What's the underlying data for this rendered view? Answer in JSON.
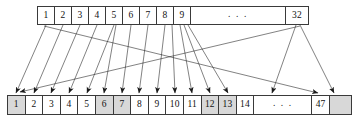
{
  "diagram": {
    "type": "array-mapping-diagram",
    "colors": {
      "shade": "#d8d8d8",
      "stroke": "#3a3a3a",
      "arrow": "#1a1a1a",
      "background": "#ffffff"
    },
    "ellipsis_text": ". . .",
    "top_array": {
      "name": "source-array",
      "size_label": "32",
      "cells": [
        {
          "label": "1",
          "shaded": false
        },
        {
          "label": "2",
          "shaded": false
        },
        {
          "label": "3",
          "shaded": false
        },
        {
          "label": "4",
          "shaded": false
        },
        {
          "label": "5",
          "shaded": false
        },
        {
          "label": "6",
          "shaded": false
        },
        {
          "label": "7",
          "shaded": false
        },
        {
          "label": "8",
          "shaded": false
        },
        {
          "label": "9",
          "shaded": false
        },
        {
          "label": ". . .",
          "shaded": false,
          "kind": "ellipsis"
        },
        {
          "label": "32",
          "shaded": false,
          "kind": "wide-last"
        }
      ]
    },
    "bottom_array": {
      "name": "destination-array",
      "size_label": "47",
      "cells": [
        {
          "label": "1",
          "shaded": true
        },
        {
          "label": "2",
          "shaded": false
        },
        {
          "label": "3",
          "shaded": false
        },
        {
          "label": "4",
          "shaded": false
        },
        {
          "label": "5",
          "shaded": false
        },
        {
          "label": "6",
          "shaded": true
        },
        {
          "label": "7",
          "shaded": true
        },
        {
          "label": "8",
          "shaded": false
        },
        {
          "label": "9",
          "shaded": false
        },
        {
          "label": "10",
          "shaded": false
        },
        {
          "label": "11",
          "shaded": false
        },
        {
          "label": "12",
          "shaded": true
        },
        {
          "label": "13",
          "shaded": true
        },
        {
          "label": "14",
          "shaded": false
        },
        {
          "label": ". . .",
          "shaded": false,
          "kind": "ellipsis"
        },
        {
          "label": "47",
          "shaded": false
        },
        {
          "label": "",
          "shaded": true,
          "kind": "tail"
        }
      ]
    },
    "arrows": [
      {
        "from_cell": "1",
        "to_cell": "2",
        "x1": 46,
        "x2": 16
      },
      {
        "from_cell": "2",
        "to_cell": "3",
        "x1": 63,
        "x2": 34
      },
      {
        "from_cell": "3",
        "to_cell": "4",
        "x1": 80,
        "x2": 51
      },
      {
        "from_cell": "4",
        "to_cell": "5",
        "x1": 97,
        "x2": 69
      },
      {
        "from_cell": "5",
        "to_cell": "6",
        "x1": 114,
        "x2": 87
      },
      {
        "from_cell": "5b",
        "to_cell": "7",
        "x1": 116,
        "x2": 104
      },
      {
        "from_cell": "6",
        "to_cell": "8",
        "x1": 131,
        "x2": 122
      },
      {
        "from_cell": "7",
        "to_cell": "9",
        "x1": 148,
        "x2": 139
      },
      {
        "from_cell": "8",
        "to_cell": "10",
        "x1": 165,
        "x2": 157
      },
      {
        "from_cell": "8b",
        "to_cell": "11",
        "x1": 172,
        "x2": 175
      },
      {
        "from_cell": "9",
        "to_cell": "12",
        "x1": 180,
        "x2": 192
      },
      {
        "from_cell": "9b",
        "to_cell": "13",
        "x1": 184,
        "x2": 210
      },
      {
        "from_cell": "9c",
        "to_cell": "14",
        "x1": 188,
        "x2": 228
      },
      {
        "from_cell": "1long",
        "to_cell": "47",
        "x1": 44,
        "x2": 318
      },
      {
        "from_cell": "32",
        "to_cell": "14r",
        "x1": 296,
        "x2": 272
      },
      {
        "from_cell": "32b",
        "to_cell": "tail",
        "x1": 300,
        "x2": 334
      }
    ]
  }
}
